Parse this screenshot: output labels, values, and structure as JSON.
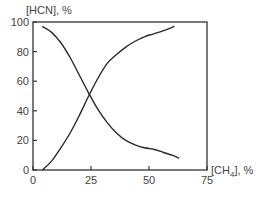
{
  "chart_data": {
    "type": "line",
    "title": "",
    "xlabel": "[CH4], %",
    "xlabel_main": "[CH",
    "xlabel_sub": "4",
    "xlabel_tail": "], %",
    "ylabel": "[HCN], %",
    "xlim": [
      0,
      75
    ],
    "ylim": [
      0,
      100
    ],
    "x_ticks": [
      0,
      25,
      50,
      75
    ],
    "y_ticks": [
      0,
      20,
      40,
      60,
      80,
      100
    ],
    "grid": false,
    "legend": null,
    "series": [
      {
        "name": "decreasing",
        "x": [
          4,
          8,
          12,
          16,
          20,
          24,
          28,
          32,
          36,
          40,
          44,
          48,
          52,
          56,
          60,
          63
        ],
        "y": [
          97,
          93,
          86,
          76,
          64,
          52,
          41,
          32,
          25,
          20,
          17,
          15,
          14,
          12,
          10,
          8
        ]
      },
      {
        "name": "increasing",
        "x": [
          4,
          8,
          12,
          16,
          20,
          24,
          28,
          32,
          36,
          40,
          44,
          48,
          52,
          56,
          61
        ],
        "y": [
          0,
          6,
          15,
          25,
          37,
          50,
          62,
          72,
          78,
          83,
          87,
          90,
          92,
          94,
          97
        ]
      }
    ]
  }
}
